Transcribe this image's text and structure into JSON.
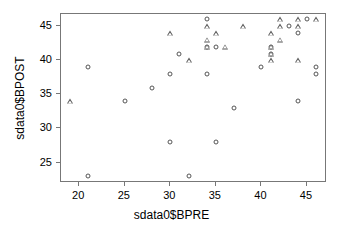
{
  "chart_data": {
    "type": "scatter",
    "title": "",
    "xlabel": "sdata0$BPRE",
    "ylabel": "sdata0$BPOST",
    "xlim": [
      18.0,
      47.2
    ],
    "ylim": [
      22.0,
      46.8
    ],
    "xticks": [
      20,
      25,
      30,
      35,
      40,
      45
    ],
    "yticks": [
      25,
      30,
      35,
      40,
      45
    ],
    "grid": false,
    "legend": null,
    "marker_types": [
      "circle",
      "triangle"
    ],
    "marker_color": "#555555",
    "frame_color": "#777777",
    "series": [
      {
        "name": "circle",
        "marker": "circle",
        "points": [
          [
            21,
            39
          ],
          [
            21,
            23
          ],
          [
            25,
            34
          ],
          [
            28,
            36
          ],
          [
            30,
            38
          ],
          [
            30,
            28
          ],
          [
            31,
            41
          ],
          [
            32,
            23
          ],
          [
            34,
            46
          ],
          [
            34,
            42
          ],
          [
            34,
            38
          ],
          [
            35,
            42
          ],
          [
            35,
            28
          ],
          [
            37,
            33
          ],
          [
            40,
            39
          ],
          [
            41,
            42
          ],
          [
            41,
            41
          ],
          [
            43,
            45
          ],
          [
            44,
            44
          ],
          [
            44,
            34
          ],
          [
            45,
            46
          ],
          [
            46,
            39
          ],
          [
            46,
            38
          ]
        ]
      },
      {
        "name": "triangle",
        "marker": "triangle",
        "points": [
          [
            19,
            34
          ],
          [
            30,
            44
          ],
          [
            32,
            40
          ],
          [
            34,
            45
          ],
          [
            34,
            43
          ],
          [
            34,
            42
          ],
          [
            35,
            44
          ],
          [
            36,
            42
          ],
          [
            38,
            45
          ],
          [
            41,
            44
          ],
          [
            41,
            42
          ],
          [
            41,
            41
          ],
          [
            41,
            40
          ],
          [
            42,
            46
          ],
          [
            42,
            45
          ],
          [
            42,
            43
          ],
          [
            44,
            46
          ],
          [
            44,
            45
          ],
          [
            44,
            40
          ],
          [
            46,
            46
          ]
        ]
      }
    ]
  },
  "layout": {
    "frame": {
      "left": 60,
      "top": 13,
      "width": 266,
      "height": 169
    }
  }
}
